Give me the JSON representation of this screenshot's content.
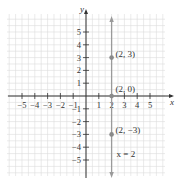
{
  "chart_data": {
    "type": "line",
    "title": "",
    "xlabel": "x",
    "ylabel": "y",
    "xlim": [
      -5.5,
      5.8
    ],
    "ylim": [
      -5.8,
      6.2
    ],
    "x_ticks": [
      -5,
      -4,
      -3,
      -2,
      -1,
      1,
      2,
      3,
      4,
      5
    ],
    "y_ticks": [
      -5,
      -4,
      -3,
      -2,
      -1,
      1,
      2,
      3,
      4,
      5
    ],
    "x_tick_labels": [
      "−5",
      "−4",
      "−3",
      "−2",
      "−1",
      "1",
      "2",
      "3",
      "4",
      "5"
    ],
    "y_tick_labels": [
      "−5",
      "−4",
      "−3",
      "−2",
      "−1",
      "1",
      "2",
      "3",
      "4",
      "5"
    ],
    "grid": true,
    "series": [
      {
        "name": "x = 2",
        "type": "vertical-line",
        "x": 2,
        "label": "x = 2"
      }
    ],
    "points": [
      {
        "x": 2,
        "y": 3,
        "label": "(2, 3)"
      },
      {
        "x": 2,
        "y": 0,
        "label": "(2, 0)"
      },
      {
        "x": 2,
        "y": -3,
        "label": "(2, −3)"
      }
    ]
  },
  "colors": {
    "grid": "#dcdcdc",
    "axis": "#333333",
    "line": "#9a9a9a",
    "point": "#8a8a8a"
  }
}
